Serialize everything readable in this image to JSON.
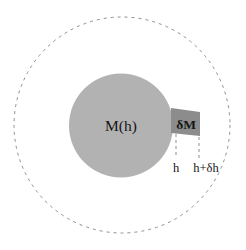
{
  "figure": {
    "background_color": "#ffffff",
    "width": 246,
    "height": 250
  },
  "labels": {
    "enclosed_mass": "M(h)",
    "shell_mass": "δM",
    "inner_radius": "h",
    "outer_radius": "h+δh"
  },
  "shapes": {
    "outer_boundary": {
      "name": "dashed-outer-circle",
      "kind": "circle",
      "cx": 122,
      "cy": 125,
      "r": 108,
      "stroke": "#8f8f8f",
      "stroke_width": 1,
      "dash": "3 4",
      "fill": "none"
    },
    "inner_sphere": {
      "name": "gray-mass-sphere",
      "kind": "circle",
      "cx": 121,
      "cy": 125.5,
      "r": 52,
      "fill": "#b2b2b2",
      "stroke": "none"
    },
    "shell_element": {
      "name": "shell-mass-box",
      "kind": "polygon",
      "points": "171,108 200,112 200,136 171,133",
      "fill": "#8c8c8c",
      "stroke": "none"
    },
    "inner_radius_line": {
      "name": "inner-radius-dashed-line",
      "kind": "line",
      "x1": 176,
      "y1": 134,
      "x2": 176,
      "y2": 158,
      "stroke": "#8f8f8f",
      "dash": "3 3"
    },
    "outer_radius_line": {
      "name": "outer-radius-dashed-line",
      "kind": "line",
      "x1": 199,
      "y1": 137,
      "x2": 199,
      "y2": 158,
      "stroke": "#8f8f8f",
      "dash": "3 3"
    }
  },
  "label_positions": {
    "enclosed_mass": {
      "x": 121,
      "y": 131
    },
    "shell_mass": {
      "x": 186,
      "y": 129
    },
    "inner_radius": {
      "x": 176,
      "y": 172
    },
    "outer_radius": {
      "x": 206,
      "y": 172
    }
  },
  "colors": {
    "sphere_fill": "#b2b2b2",
    "shell_fill": "#8c8c8c",
    "dash_stroke": "#8f8f8f",
    "text": "#151515",
    "background": "#ffffff"
  }
}
